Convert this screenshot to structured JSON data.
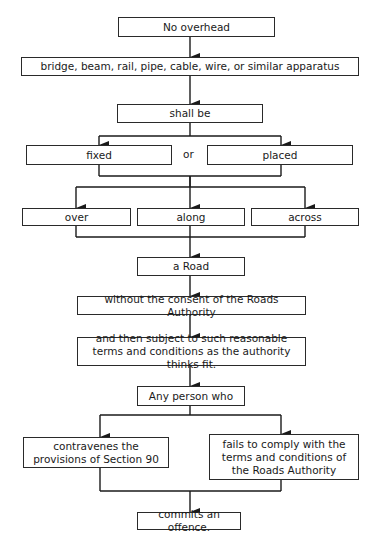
{
  "diagram": {
    "type": "flowchart",
    "nodes": {
      "no_overhead": "No overhead",
      "apparatus": "bridge, beam, rail, pipe, cable, wire, or similar apparatus",
      "shall_be": "shall be",
      "fixed": "fixed",
      "or": "or",
      "placed": "placed",
      "over": "over",
      "along": "along",
      "across": "across",
      "a_road": "a Road",
      "without_consent": "without the consent of the Roads Authority",
      "subject_terms": "and then subject to such reasonable terms and conditions as the authority thinks fit.",
      "any_person": "Any person who",
      "contravenes": "contravenes the provisions of Section 90",
      "fails_comply": "fails to comply with the terms and conditions of the Roads Authority",
      "commits_offence": "commits an offence."
    },
    "edges": [
      [
        "no_overhead",
        "apparatus"
      ],
      [
        "apparatus",
        "shall_be"
      ],
      [
        "shall_be",
        "fixed"
      ],
      [
        "shall_be",
        "placed"
      ],
      [
        "fixed",
        "over"
      ],
      [
        "fixed",
        "along"
      ],
      [
        "fixed",
        "across"
      ],
      [
        "placed",
        "over"
      ],
      [
        "placed",
        "along"
      ],
      [
        "placed",
        "across"
      ],
      [
        "over",
        "a_road"
      ],
      [
        "along",
        "a_road"
      ],
      [
        "across",
        "a_road"
      ],
      [
        "a_road",
        "without_consent"
      ],
      [
        "without_consent",
        "subject_terms"
      ],
      [
        "subject_terms",
        "any_person"
      ],
      [
        "any_person",
        "contravenes"
      ],
      [
        "any_person",
        "fails_comply"
      ],
      [
        "contravenes",
        "commits_offence"
      ],
      [
        "fails_comply",
        "commits_offence"
      ]
    ],
    "colors": {
      "line": "#1a1a1a",
      "box_border": "#2a2a2a",
      "background": "#ffffff"
    }
  }
}
